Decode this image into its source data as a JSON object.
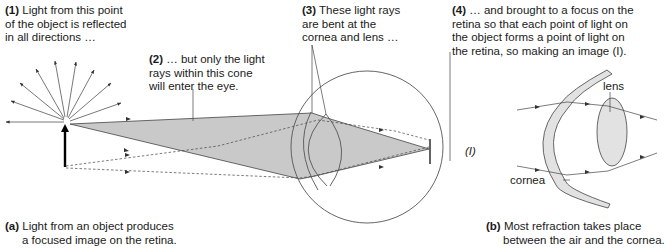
{
  "figure": {
    "panel_a": {
      "annotations": [
        {
          "num": "(1)",
          "lines": [
            "Light from this point",
            "of the object is reflected",
            "in all directions …"
          ]
        },
        {
          "num": "(2)",
          "lines": [
            "… but only the light",
            "rays within this cone",
            "will enter the eye."
          ]
        },
        {
          "num": "(3)",
          "lines": [
            "These light rays",
            "are bent at the",
            "cornea and lens …"
          ]
        },
        {
          "num": "(4)",
          "lines": [
            "… and brought to a focus on the",
            "retina so that each point of light on",
            "the object forms a point of light on",
            "the retina, so making an image (I)."
          ]
        }
      ],
      "image_label": "(I)",
      "caption_num": "(a)",
      "caption_lines": [
        "Light from an object produces",
        "a focused image on the retina."
      ]
    },
    "panel_b": {
      "labels": {
        "lens": "lens",
        "cornea": "cornea"
      },
      "caption_num": "(b)",
      "caption_lines": [
        "Most refraction takes place",
        "between the air and the cornea."
      ]
    },
    "colors": {
      "cone_fill": "#c9c9c9",
      "lens_fill": "#e2e2e2",
      "line": "#4a4a4a",
      "object_arrow": "#000000"
    }
  }
}
